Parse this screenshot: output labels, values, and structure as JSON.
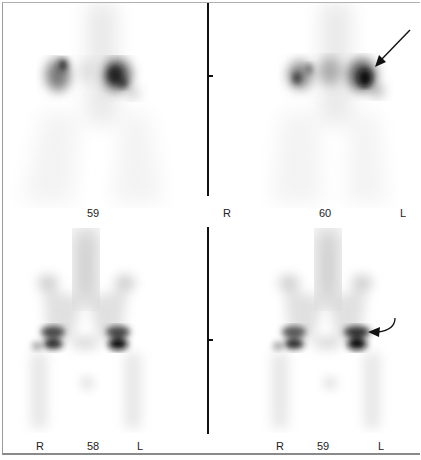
{
  "figure": {
    "panels": [
      {
        "id": "top-left",
        "region": "kidneys (posterior view)",
        "frame_number": "59",
        "left_marker": "",
        "right_marker": ""
      },
      {
        "id": "top-right",
        "region": "kidneys (posterior view)",
        "frame_number": "60",
        "left_marker": "R",
        "right_marker": "L",
        "annotation": "straight arrow pointing to left kidney"
      },
      {
        "id": "bottom-left",
        "region": "pelvis / hips (anterior view)",
        "frame_number": "58",
        "left_marker": "R",
        "right_marker": "L"
      },
      {
        "id": "bottom-right",
        "region": "pelvis / hips (anterior view)",
        "frame_number": "59",
        "left_marker": "R",
        "right_marker": "L",
        "annotation": "curved arrow pointing to left hip"
      }
    ],
    "colors": {
      "background": "#ffffff",
      "uptake_dark": "#111111",
      "uptake_light": "#cfcfcf",
      "divider": "#111111",
      "label": "#222222"
    }
  }
}
